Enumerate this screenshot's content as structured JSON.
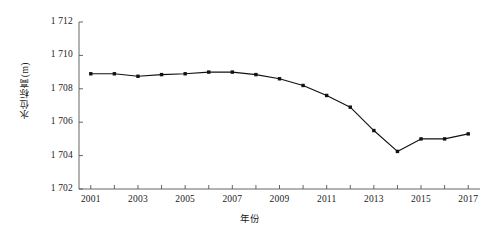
{
  "chart_data": {
    "type": "line",
    "title": "",
    "xlabel": "年份",
    "ylabel": "水位标高(m)",
    "x": [
      2001,
      2002,
      2003,
      2004,
      2005,
      2006,
      2007,
      2008,
      2009,
      2010,
      2011,
      2012,
      2013,
      2014,
      2015,
      2016,
      2017
    ],
    "values": [
      1708.9,
      1708.9,
      1708.75,
      1708.85,
      1708.9,
      1709.0,
      1709.0,
      1708.85,
      1708.6,
      1708.2,
      1707.6,
      1706.9,
      1705.5,
      1704.25,
      1705.0,
      1705.0,
      1705.3
    ],
    "series": [
      {
        "name": "水位标高",
        "values": [
          1708.9,
          1708.9,
          1708.75,
          1708.85,
          1708.9,
          1709.0,
          1709.0,
          1708.85,
          1708.6,
          1708.2,
          1707.6,
          1706.9,
          1705.5,
          1704.25,
          1705.0,
          1705.0,
          1705.3
        ]
      }
    ],
    "xlim": [
      2000.5,
      2017.5
    ],
    "ylim": [
      1702,
      1712
    ],
    "y_ticks": [
      1702,
      1704,
      1706,
      1708,
      1710,
      1712
    ],
    "y_tick_labels": [
      "1 702",
      "1 704",
      "1 706",
      "1 708",
      "1 710",
      "1 712"
    ],
    "x_ticks": [
      2001,
      2002,
      2003,
      2004,
      2005,
      2006,
      2007,
      2008,
      2009,
      2010,
      2011,
      2012,
      2013,
      2014,
      2015,
      2016,
      2017
    ],
    "x_tick_labels": [
      "2001",
      "",
      "2003",
      "",
      "2005",
      "",
      "2007",
      "",
      "2009",
      "",
      "2011",
      "",
      "2013",
      "",
      "2015",
      "",
      "2017"
    ],
    "grid": false,
    "legend": "none",
    "marker": "filled-square",
    "line_color": "#111111",
    "marker_color": "#111111",
    "axis_color": "#555555"
  }
}
